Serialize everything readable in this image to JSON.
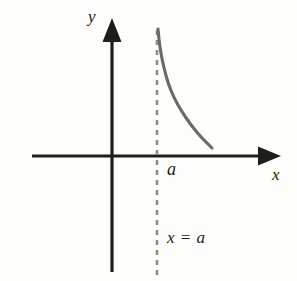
{
  "figure": {
    "index_label": ")",
    "background_color": "#fdfdfc",
    "axis_color": "#1e1e1e",
    "curve_color": "#6a6a6a",
    "asymptote_color": "#8c8c8c",
    "width": 297,
    "height": 281
  },
  "labels": {
    "y_axis": "y",
    "x_axis": "x",
    "point_a": "a",
    "asymptote_equation": "x = a"
  },
  "chart_data": {
    "type": "line",
    "title": "",
    "xlabel": "x",
    "ylabel": "y",
    "grid": false,
    "legend": null,
    "origin_px": [
      112,
      156
    ],
    "axes": {
      "x_axis_y_px": 156,
      "x_axis_start_px": 32,
      "x_axis_end_px": 281,
      "y_axis_x_px": 112,
      "y_axis_top_px": 18,
      "y_axis_bottom_px": 272,
      "arrowheads": [
        "x-positive",
        "y-positive"
      ]
    },
    "annotations": [
      {
        "name": "vertical-asymptote",
        "type": "dashed-line",
        "label": "x = a",
        "x_px": 157,
        "y_start_px": 30,
        "y_end_px": 276,
        "dash": [
          5,
          5
        ],
        "color": "#8c8c8c"
      },
      {
        "name": "point-a-tick",
        "type": "axis-label",
        "label": "a",
        "x_px": 168,
        "y_px": 170
      }
    ],
    "series": [
      {
        "name": "decaying-branch",
        "description": "Curve with vertical asymptote at x = a, decreasing toward the x-axis as x increases",
        "color": "#6a6a6a",
        "points_px": [
          [
            158,
            29
          ],
          [
            159,
            40
          ],
          [
            161,
            54
          ],
          [
            164,
            68
          ],
          [
            168,
            83
          ],
          [
            174,
            98
          ],
          [
            182,
            112
          ],
          [
            191,
            125
          ],
          [
            200,
            136
          ],
          [
            207,
            143
          ],
          [
            212,
            148
          ]
        ]
      }
    ]
  }
}
